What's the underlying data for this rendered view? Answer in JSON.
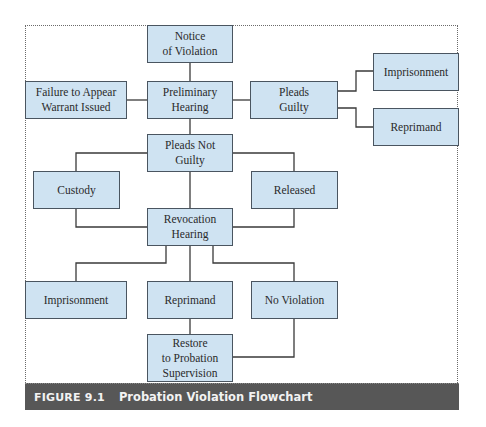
{
  "diagram": {
    "type": "flowchart",
    "node_fill": "#cfe3f2",
    "node_border": "#4a5560",
    "connector_color": "#3a3a3a",
    "nodes": {
      "notice": "Notice\nof Violation",
      "preliminary": "Preliminary\nHearing",
      "failure": "Failure to Appear\nWarrant Issued",
      "pleads_guilty": "Pleads\nGuilty",
      "imprisonment_top": "Imprisonment",
      "reprimand_top": "Reprimand",
      "pleads_not_guilty": "Pleads Not\nGuilty",
      "custody": "Custody",
      "released": "Released",
      "revocation": "Revocation\nHearing",
      "imprisonment_bottom": "Imprisonment",
      "reprimand_bottom": "Reprimand",
      "no_violation": "No Violation",
      "restore": "Restore\nto Probation\nSupervision"
    },
    "edges": [
      [
        "notice",
        "preliminary"
      ],
      [
        "preliminary",
        "failure"
      ],
      [
        "preliminary",
        "pleads_guilty"
      ],
      [
        "pleads_guilty",
        "imprisonment_top"
      ],
      [
        "pleads_guilty",
        "reprimand_top"
      ],
      [
        "preliminary",
        "pleads_not_guilty"
      ],
      [
        "pleads_not_guilty",
        "custody"
      ],
      [
        "pleads_not_guilty",
        "released"
      ],
      [
        "pleads_not_guilty",
        "revocation"
      ],
      [
        "custody",
        "revocation"
      ],
      [
        "released",
        "revocation"
      ],
      [
        "revocation",
        "imprisonment_bottom"
      ],
      [
        "revocation",
        "reprimand_bottom"
      ],
      [
        "revocation",
        "no_violation"
      ],
      [
        "reprimand_bottom",
        "restore"
      ],
      [
        "no_violation",
        "restore"
      ]
    ]
  },
  "caption": {
    "figure_number": "FIGURE 9.1",
    "title": "Probation Violation Flowchart",
    "background": "#575757"
  }
}
